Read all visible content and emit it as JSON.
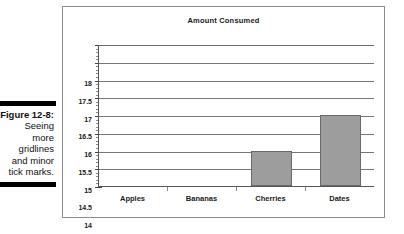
{
  "caption": {
    "figure_number": "Figure 12-8:",
    "lines": [
      "Seeing",
      "more",
      "gridlines",
      "and minor",
      "tick marks."
    ]
  },
  "chart_data": {
    "type": "bar",
    "title": "Amount Consumed",
    "xlabel": "",
    "ylabel": "",
    "categories": [
      "Apples",
      "Bananas",
      "Cherries",
      "Dates"
    ],
    "values": [
      14,
      14,
      15,
      16
    ],
    "ylim": [
      14,
      18
    ],
    "ytick_labels": [
      "18",
      "17.5",
      "17",
      "16.5",
      "16",
      "15.5",
      "15",
      "14.5",
      "14"
    ],
    "ytick_values": [
      18,
      17.5,
      17,
      16.5,
      16,
      15.5,
      15,
      14.5,
      14
    ],
    "minor_tick_step": 0.1,
    "grid": true,
    "legend": "none",
    "bar_color": "#9d9d9d",
    "bar_border_color": "#6a6a6a",
    "gridline_color": "#777777",
    "axis_color": "#555555"
  }
}
